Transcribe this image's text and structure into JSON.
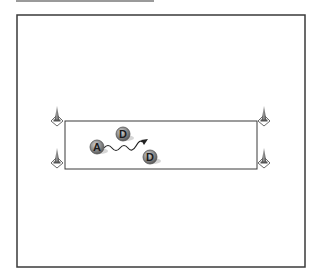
{
  "diagram": {
    "type": "drill-field",
    "field": {
      "label": "outer-field",
      "stroke": "#3a3a3a"
    },
    "zone": {
      "label": "inner-grid",
      "stroke": "#3a3a3a"
    },
    "cones": [
      {
        "id": "cone-top-left"
      },
      {
        "id": "cone-bottom-left"
      },
      {
        "id": "cone-top-right"
      },
      {
        "id": "cone-bottom-right"
      }
    ],
    "players": [
      {
        "id": "player-attacker",
        "label": "A",
        "role": "attacker"
      },
      {
        "id": "player-defender-1",
        "label": "D",
        "role": "defender"
      },
      {
        "id": "player-defender-2",
        "label": "D",
        "role": "defender"
      }
    ],
    "movement": {
      "type": "dribble-path",
      "from": "A",
      "icon": "wavy-arrow"
    },
    "colors": {
      "player_fill": "#8c8c8c",
      "player_stroke": "#555555",
      "line": "#222222",
      "cone": "#6a6a6a"
    }
  }
}
